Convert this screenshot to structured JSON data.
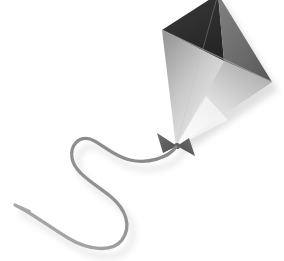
{
  "image": {
    "title": "Kite",
    "subject": "kite-with-string",
    "style": "grayscale-illustration",
    "background_color": "#ffffff",
    "width": 284,
    "height": 261,
    "caption": "Grayscale illustration of a diamond kite with a bow and a curling string"
  },
  "kite": {
    "label": "Kite",
    "shape": "diamond",
    "vertices": {
      "top": [
        218,
        -6
      ],
      "left": [
        162,
        30
      ],
      "right": [
        272,
        82
      ],
      "bottom": [
        176,
        147
      ]
    },
    "facets": [
      {
        "name": "upper-left-facet",
        "label": "Upper left sail panel",
        "color_start": "#3a3a3a",
        "color_end": "#242424",
        "points": "218,-6 162,30 224,61"
      },
      {
        "name": "upper-right-facet",
        "label": "Upper right sail panel",
        "color_start": "#7b7b7b",
        "color_end": "#5c5c5c",
        "points": "218,-6 272,82 224,61"
      },
      {
        "name": "lower-left-facet",
        "label": "Lower left sail panel",
        "color_start": "#9a9a9a",
        "color_end": "#ececec",
        "points": "162,30 224,61 176,147"
      },
      {
        "name": "lower-right-facet",
        "label": "Lower right sail panel",
        "color_start": "#b4b4b4",
        "color_end": "#f4f4f4",
        "points": "272,82 224,61 176,147"
      }
    ],
    "spar": {
      "name": "cross-spar",
      "label": "Cross spar",
      "color": "#9b9b9b",
      "from": [
        162,
        30
      ],
      "to": [
        272,
        82
      ]
    }
  },
  "bow": {
    "label": "Bow",
    "color_dark": "#5e5e5e",
    "color_mid": "#8a8a8a",
    "center": [
      176,
      146
    ],
    "left_wing": "176,146 158,134 163,152",
    "right_wing": "176,146 194,155 188,139"
  },
  "string": {
    "label": "Kite string",
    "color": "#8e8e8e",
    "color_light": "#b9b9b9",
    "width": 3.2,
    "path": "M 176 147 C 168 158, 148 164, 130 160 C 112 156, 100 142, 90 139 C 78 136, 70 146, 72 158 C 74 172, 92 182, 110 196 C 126 209, 132 226, 122 240 C 112 253, 88 250, 68 238 C 48 226, 30 212, 15 205",
    "tip": [
      15,
      205
    ]
  },
  "shadow": {
    "label": "Drop shadow",
    "color": "#c9c9c9",
    "offset_x": 6,
    "offset_y": 8,
    "blur": 4
  }
}
